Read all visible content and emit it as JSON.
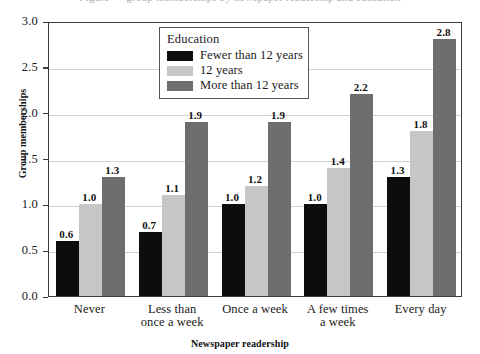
{
  "caption": {
    "top_fragment": "Figure — group memberships by newspaper readership and education"
  },
  "chart_data": {
    "type": "bar",
    "title": "",
    "xlabel": "Newspaper readership",
    "ylabel": "Group memberships",
    "categories": [
      "Never",
      "Less than\nonce a week",
      "Once a week",
      "A few times\na week",
      "Every day"
    ],
    "series": [
      {
        "name": "Fewer than 12 years",
        "color": "#0d0d0d",
        "values": [
          0.6,
          0.7,
          1.0,
          1.0,
          1.3
        ],
        "labels": [
          "0.6",
          "0.7",
          "1.0",
          "1.0",
          "1.3"
        ]
      },
      {
        "name": "12 years",
        "color": "#c6c6c6",
        "values": [
          1.0,
          1.1,
          1.2,
          1.4,
          1.8
        ],
        "labels": [
          "1.0",
          "1.1",
          "1.2",
          "1.4",
          "1.8"
        ]
      },
      {
        "name": "More than 12 years",
        "color": "#6e6e6e",
        "values": [
          1.3,
          1.9,
          1.9,
          2.2,
          2.8
        ],
        "labels": [
          "1.3",
          "1.9",
          "1.9",
          "2.2",
          "2.8"
        ]
      }
    ],
    "ylim": [
      0.0,
      3.0
    ],
    "ytick_values": [
      0.0,
      0.5,
      1.0,
      1.5,
      2.0,
      2.5,
      3.0
    ],
    "ytick_labels": [
      "0.0",
      "0.5",
      "1.0",
      "1.5",
      "2.0",
      "2.5",
      "3.0"
    ],
    "grid": true,
    "grid_axis": "y",
    "legend_title": "Education",
    "legend_position": "top-center",
    "bar_value_labels": true
  },
  "legend": {
    "title": "Education",
    "items": [
      {
        "label": "Fewer than 12 years",
        "color": "#0d0d0d"
      },
      {
        "label": "12 years",
        "color": "#c6c6c6"
      },
      {
        "label": "More than 12 years",
        "color": "#6e6e6e"
      }
    ]
  },
  "axes": {
    "y_label": "Group memberships",
    "x_label": "Newspaper readership",
    "y_ticks": [
      "3.0",
      "2.5",
      "2.0",
      "1.5",
      "1.0",
      "0.5",
      "0.0"
    ],
    "x_ticks": [
      {
        "line1": "Never",
        "line2": ""
      },
      {
        "line1": "Less than",
        "line2": "once a week"
      },
      {
        "line1": "Once a week",
        "line2": ""
      },
      {
        "line1": "A few times",
        "line2": "a week"
      },
      {
        "line1": "Every day",
        "line2": ""
      }
    ]
  },
  "colors": {
    "frame": "#3c3c3c",
    "gridline": "#d2d2d2",
    "background": "#ffffff",
    "text": "#111111"
  }
}
